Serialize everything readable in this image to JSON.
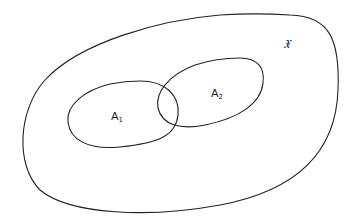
{
  "diagram": {
    "type": "venn",
    "universe": {
      "label": "𝔛"
    },
    "sets": [
      {
        "name": "A",
        "subscript": "1"
      },
      {
        "name": "A",
        "subscript": "2"
      }
    ],
    "stroke_color": "#222222",
    "background": "#ffffff"
  }
}
